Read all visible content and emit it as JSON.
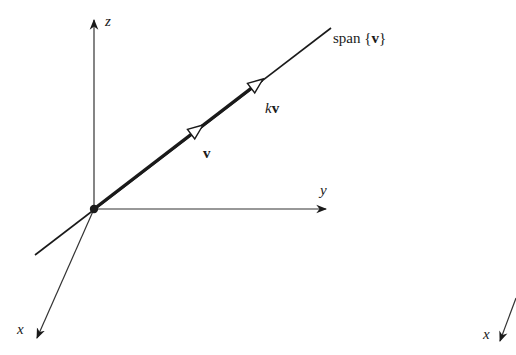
{
  "figure": {
    "colors": {
      "background": "#ffffff",
      "ink": "#1a1a1a",
      "axis": "#333333"
    },
    "axes": {
      "z_label": "z",
      "y_label": "y",
      "x_label": "x",
      "x_label_duplicate": "x"
    },
    "vectors": {
      "v_label": "v",
      "kv_scalar": "k",
      "kv_vector": "v"
    },
    "span_label": {
      "prefix": "span",
      "open_brace": "{",
      "vector": "v",
      "close_brace": "}"
    },
    "geometry": {
      "origin": [
        94,
        209
      ],
      "z_axis_end": [
        94,
        18
      ],
      "y_axis_end": [
        327,
        209
      ],
      "x_axis_end": [
        36,
        340
      ],
      "span_line_start": [
        35,
        255
      ],
      "span_line_end": [
        331,
        28
      ],
      "v_arrow_tip": [
        202,
        126
      ],
      "kv_arrow_tip": [
        262,
        80
      ]
    }
  }
}
